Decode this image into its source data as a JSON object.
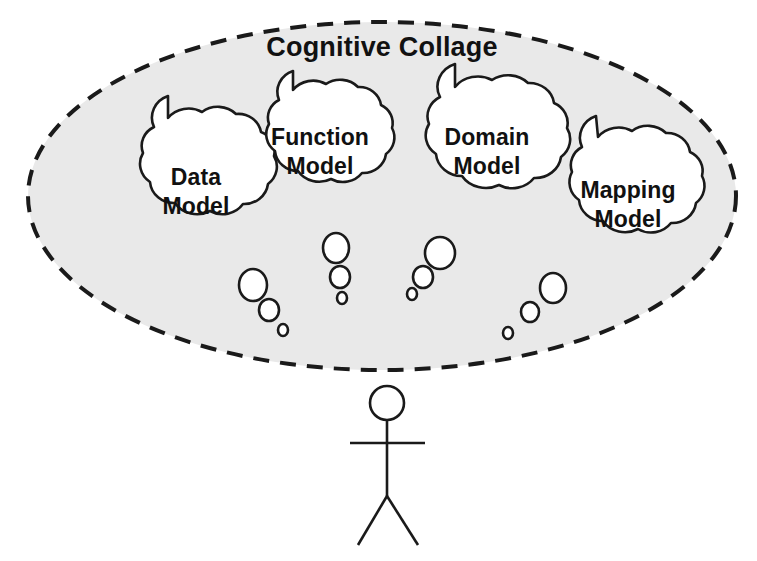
{
  "canvas": {
    "width": 757,
    "height": 561,
    "background_color": "#ffffff"
  },
  "diagram": {
    "type": "concept-diagram",
    "title": "Cognitive Collage",
    "boundary": {
      "shape": "dashed-ellipse",
      "fill_color": "#e9e9e9",
      "stroke_color": "#1a1a1a",
      "center_x": 382,
      "center_y": 196,
      "radius_x": 354,
      "radius_y": 174
    },
    "clouds": [
      {
        "id": "data-model",
        "label_line_1": "Data",
        "label_line_2": "Model",
        "center_x": 198,
        "center_y": 190,
        "radius_x": 78,
        "radius_y": 82,
        "z": 1
      },
      {
        "id": "function-model",
        "label_line_1": "Function",
        "label_line_2": "Model",
        "center_x": 320,
        "center_y": 160,
        "radius_x": 72,
        "radius_y": 78,
        "z": 2
      },
      {
        "id": "domain-model",
        "label_line_1": "Domain",
        "label_line_2": "Model",
        "center_x": 487,
        "center_y": 160,
        "radius_x": 82,
        "radius_y": 85,
        "z": 3
      },
      {
        "id": "mapping-model",
        "label_line_1": "Mapping",
        "label_line_2": "Model",
        "center_x": 627,
        "center_y": 207,
        "radius_x": 76,
        "radius_y": 80,
        "z": 4
      }
    ],
    "bubble_trails": [
      {
        "id": "trail-data-model",
        "bubbles": [
          {
            "cx": 253,
            "cy": 285,
            "rx": 14,
            "ry": 16
          },
          {
            "cx": 269,
            "cy": 310,
            "rx": 10,
            "ry": 11
          },
          {
            "cx": 283,
            "cy": 330,
            "rx": 5,
            "ry": 6
          }
        ]
      },
      {
        "id": "trail-function-model",
        "bubbles": [
          {
            "cx": 336,
            "cy": 248,
            "rx": 13,
            "ry": 15
          },
          {
            "cx": 340,
            "cy": 277,
            "rx": 10,
            "ry": 11
          },
          {
            "cx": 342,
            "cy": 298,
            "rx": 5,
            "ry": 6
          }
        ]
      },
      {
        "id": "trail-domain-model",
        "bubbles": [
          {
            "cx": 440,
            "cy": 253,
            "rx": 15,
            "ry": 16
          },
          {
            "cx": 423,
            "cy": 277,
            "rx": 10,
            "ry": 11
          },
          {
            "cx": 412,
            "cy": 294,
            "rx": 5,
            "ry": 6
          }
        ]
      },
      {
        "id": "trail-mapping-model",
        "bubbles": [
          {
            "cx": 553,
            "cy": 288,
            "rx": 13,
            "ry": 15
          },
          {
            "cx": 530,
            "cy": 312,
            "rx": 9,
            "ry": 10
          },
          {
            "cx": 508,
            "cy": 333,
            "rx": 5,
            "ry": 6
          }
        ]
      }
    ],
    "stick_figure": {
      "id": "person",
      "head_cx": 387,
      "head_cy": 403,
      "head_r": 17,
      "body_top_y": 420,
      "body_bottom_y": 496,
      "arms_y": 443,
      "arms_left_x": 350,
      "arms_right_x": 425,
      "leg_left_x": 358,
      "leg_right_x": 418,
      "leg_bottom_y": 545
    }
  }
}
